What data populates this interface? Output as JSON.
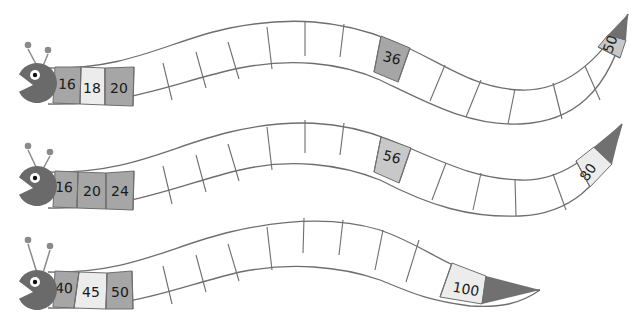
{
  "colors": {
    "body_stroke": "#6e6e6e",
    "head": "#6a6a6a",
    "tail": "#707070",
    "cell_dark": "#a6a6a6",
    "cell_light": "#ececec",
    "cell_mid": "#c8c8c8",
    "cell_empty": "#ffffff",
    "antenna": "#8a8a8a"
  },
  "worms": [
    {
      "id": "worm-1",
      "top_path": "M 48 68 C 130 70, 170 40, 230 28 C 290 16, 340 20, 390 40 C 440 60, 470 88, 520 90 C 565 92, 600 60, 628 14",
      "bottom_path": "M 48 104 C 130 106, 180 80, 240 68 C 290 58, 340 62, 380 80 C 430 104, 470 126, 520 124 C 570 122, 610 96, 628 14",
      "head": {
        "cx": 37,
        "cy": 83,
        "r": 20,
        "eye_cx": 33,
        "eye_cy": 72,
        "antennae": [
          [
            28,
            45
          ],
          [
            48,
            50
          ]
        ]
      },
      "dividers": [
        [
          [
            81,
            67
          ],
          [
            80,
            104
          ]
        ],
        [
          [
            105,
            68
          ],
          [
            105,
            105
          ]
        ],
        [
          [
            134,
            67
          ],
          [
            133,
            106
          ]
        ],
        [
          [
            163,
            63
          ],
          [
            172,
            100
          ]
        ],
        [
          [
            196,
            52
          ],
          [
            206,
            88
          ]
        ],
        [
          [
            228,
            42
          ],
          [
            239,
            79
          ]
        ],
        [
          [
            267,
            27
          ],
          [
            272,
            69
          ]
        ],
        [
          [
            305,
            21
          ],
          [
            305,
            56
          ]
        ],
        [
          [
            344,
            24
          ],
          [
            340,
            57
          ]
        ],
        [
          [
            381,
            36
          ],
          [
            374,
            72
          ]
        ],
        [
          [
            410,
            48
          ],
          [
            398,
            82
          ]
        ],
        [
          [
            445,
            65
          ],
          [
            430,
            101
          ]
        ],
        [
          [
            481,
            80
          ],
          [
            466,
            117
          ]
        ],
        [
          [
            515,
            89
          ],
          [
            508,
            124
          ]
        ],
        [
          [
            553,
            83
          ],
          [
            562,
            119
          ]
        ],
        [
          [
            585,
            66
          ],
          [
            600,
            100
          ]
        ],
        [
          [
            598,
            47
          ],
          [
            620,
            58
          ]
        ],
        [
          [
            608,
            35
          ],
          [
            626,
            40
          ]
        ]
      ],
      "cells": [
        {
          "label": "16",
          "fill": "cell_dark",
          "x": 67,
          "y": 84,
          "rot": 2,
          "poly": "55,67 81,67 80,104 53,103"
        },
        {
          "label": "18",
          "fill": "cell_light",
          "x": 92,
          "y": 88,
          "rot": 0,
          "poly": "81,67 105,68 105,105 80,104"
        },
        {
          "label": "20",
          "fill": "cell_dark",
          "x": 119,
          "y": 88,
          "rot": 0,
          "poly": "105,68 134,67 133,106 105,105"
        },
        {
          "label": "36",
          "fill": "cell_dark",
          "x": 392,
          "y": 58,
          "rot": 15,
          "poly": "381,36 410,48 398,82 374,72"
        },
        {
          "label": "50",
          "fill": "cell_mid",
          "x": 610,
          "y": 44,
          "rot": -70,
          "poly": "598,47 608,35 626,40 620,58"
        }
      ],
      "tail_poly": "608,35 628,14 626,40"
    },
    {
      "id": "worm-2",
      "top_path": "M 48 172 C 130 174, 170 146, 230 132 C 290 118, 340 120, 390 140 C 440 160, 470 178, 520 180 C 565 182, 595 150, 622 124",
      "bottom_path": "M 48 208 C 130 210, 180 184, 240 170 C 290 158, 340 164, 380 180 C 430 206, 470 218, 520 216 C 565 214, 605 190, 622 124",
      "head": {
        "cx": 37,
        "cy": 186,
        "r": 20,
        "eye_cx": 33,
        "eye_cy": 175,
        "antennae": [
          [
            28,
            146
          ],
          [
            50,
            152
          ]
        ]
      },
      "dividers": [
        [
          [
            78,
            172
          ],
          [
            77,
            208
          ]
        ],
        [
          [
            106,
            173
          ],
          [
            106,
            209
          ]
        ],
        [
          [
            134,
            171
          ],
          [
            133,
            210
          ]
        ],
        [
          [
            163,
            166
          ],
          [
            172,
            204
          ]
        ],
        [
          [
            196,
            155
          ],
          [
            206,
            192
          ]
        ],
        [
          [
            228,
            144
          ],
          [
            239,
            181
          ]
        ],
        [
          [
            267,
            127
          ],
          [
            272,
            170
          ]
        ],
        [
          [
            305,
            120
          ],
          [
            305,
            153
          ]
        ],
        [
          [
            344,
            123
          ],
          [
            340,
            155
          ]
        ],
        [
          [
            381,
            137
          ],
          [
            374,
            172
          ]
        ],
        [
          [
            411,
            148
          ],
          [
            399,
            183
          ]
        ],
        [
          [
            446,
            163
          ],
          [
            432,
            200
          ]
        ],
        [
          [
            481,
            173
          ],
          [
            473,
            210
          ]
        ],
        [
          [
            515,
            180
          ],
          [
            516,
            216
          ]
        ],
        [
          [
            553,
            174
          ],
          [
            566,
            210
          ]
        ],
        [
          [
            576,
            161
          ],
          [
            590,
            187
          ]
        ],
        [
          [
            594,
            147
          ],
          [
            612,
            164
          ]
        ]
      ],
      "cells": [
        {
          "label": "16",
          "fill": "cell_dark",
          "x": 64,
          "y": 187,
          "rot": 2,
          "poly": "55,171 78,172 77,208 53,207"
        },
        {
          "label": "20",
          "fill": "cell_dark",
          "x": 92,
          "y": 191,
          "rot": 0,
          "poly": "78,172 106,173 106,209 77,208"
        },
        {
          "label": "24",
          "fill": "cell_dark",
          "x": 120,
          "y": 191,
          "rot": 0,
          "poly": "106,173 134,171 133,210 106,209"
        },
        {
          "label": "56",
          "fill": "cell_mid",
          "x": 392,
          "y": 157,
          "rot": 15,
          "poly": "381,137 411,148 399,183 374,172"
        },
        {
          "label": "80",
          "fill": "cell_light",
          "x": 588,
          "y": 172,
          "rot": -55,
          "poly": "576,161 594,147 612,164 590,187"
        }
      ],
      "tail_poly": "594,147 622,124 612,164"
    },
    {
      "id": "worm-3",
      "top_path": "M 48 272 C 130 274, 170 246, 230 232 C 290 218, 340 218, 380 230 C 420 244, 440 262, 470 272 C 500 284, 520 290, 540 290",
      "bottom_path": "M 48 308 C 130 310, 180 286, 240 272 C 290 262, 340 266, 380 280 C 410 292, 425 300, 470 306 C 500 308, 520 304, 540 290",
      "head": {
        "cx": 37,
        "cy": 290,
        "r": 20,
        "eye_cx": 33,
        "eye_cy": 258,
        "antennae": [
          [
            28,
            240
          ],
          [
            50,
            246
          ]
        ]
      },
      "dividers": [
        [
          [
            79,
            272
          ],
          [
            74,
            308
          ]
        ],
        [
          [
            107,
            273
          ],
          [
            106,
            309
          ]
        ],
        [
          [
            132,
            271
          ],
          [
            133,
            309
          ]
        ],
        [
          [
            163,
            266
          ],
          [
            172,
            304
          ]
        ],
        [
          [
            196,
            255
          ],
          [
            206,
            292
          ]
        ],
        [
          [
            228,
            244
          ],
          [
            239,
            281
          ]
        ],
        [
          [
            267,
            227
          ],
          [
            272,
            270
          ]
        ],
        [
          [
            304,
            218
          ],
          [
            303,
            253
          ]
        ],
        [
          [
            343,
            220
          ],
          [
            339,
            255
          ]
        ],
        [
          [
            383,
            230
          ],
          [
            375,
            270
          ]
        ],
        [
          [
            419,
            240
          ],
          [
            406,
            282
          ]
        ],
        [
          [
            452,
            263
          ],
          [
            440,
            297
          ]
        ],
        [
          [
            486,
            276
          ],
          [
            482,
            304
          ]
        ]
      ],
      "cells": [
        {
          "label": "40",
          "fill": "cell_dark",
          "x": 64,
          "y": 288,
          "rot": 2,
          "poly": "55,271 79,272 74,308 53,307"
        },
        {
          "label": "45",
          "fill": "cell_light",
          "x": 91,
          "y": 292,
          "rot": 0,
          "poly": "79,272 107,273 106,309 74,308"
        },
        {
          "label": "50",
          "fill": "cell_dark",
          "x": 120,
          "y": 292,
          "rot": 0,
          "poly": "107,273 132,271 133,309 106,309"
        },
        {
          "label": "100",
          "fill": "cell_light",
          "x": 466,
          "y": 289,
          "rot": 10,
          "poly": "452,263 486,276 482,304 440,297"
        }
      ],
      "tail_poly": "486,276 540,290 482,304"
    }
  ]
}
